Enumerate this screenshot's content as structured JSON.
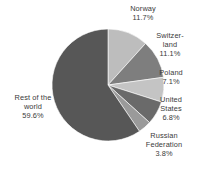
{
  "chart_data": {
    "type": "pie",
    "title": "",
    "subtitle": "",
    "xlabel": "",
    "ylabel": "",
    "legend_position": "none",
    "grid": false,
    "start_angle_deg": 0,
    "direction": "clockwise",
    "categories": [
      "Norway",
      "Switzerland",
      "Poland",
      "United States",
      "Russian Federation",
      "Rest of the world"
    ],
    "values": [
      11.7,
      11.1,
      7.1,
      6.8,
      3.8,
      59.6
    ],
    "units": "percent",
    "slices": [
      {
        "name": "Norway",
        "label_text": "Norway\n11.7%",
        "value": 11.7,
        "value_text": "11.7%",
        "color": "#bdbdbd",
        "start_deg": 0,
        "end_deg": 42.12
      },
      {
        "name": "Switzerland",
        "label_text": "Switzer-\nland\n11.1%",
        "value": 11.1,
        "value_text": "11.1%",
        "color": "#7e7e7e",
        "start_deg": 42.12,
        "end_deg": 82.08
      },
      {
        "name": "Poland",
        "label_text": "Poland\n7.1%",
        "value": 7.1,
        "value_text": "7.1%",
        "color": "#c4c4c4",
        "start_deg": 82.08,
        "end_deg": 107.64
      },
      {
        "name": "United States",
        "label_text": "United\nStates\n6.8%",
        "value": 6.8,
        "value_text": "6.8%",
        "color": "#6a6a6a",
        "start_deg": 107.64,
        "end_deg": 132.12
      },
      {
        "name": "Russian Federation",
        "label_text": "Russian\nFederation\n3.8%",
        "value": 3.8,
        "value_text": "3.8%",
        "color": "#9a9a9a",
        "start_deg": 132.12,
        "end_deg": 145.8
      },
      {
        "name": "Rest of the world",
        "label_text": "Rest of the\nworld\n59.6%",
        "value": 59.6,
        "value_text": "59.6%",
        "color": "#575757",
        "start_deg": 145.8,
        "end_deg": 360
      }
    ]
  },
  "labels": {
    "norway": "Norway\n11.7%",
    "switzerland": "Switzer-\nland\n11.1%",
    "poland": "Poland\n7.1%",
    "united_states": "United\nStates\n6.8%",
    "russian_federation": "Russian\nFederation\n3.8%",
    "rest_of_world": "Rest of the\nworld\n59.6%"
  },
  "geometry": {
    "center_x": 108,
    "center_y": 85,
    "radius": 56
  },
  "colors": {
    "background": "#ffffff",
    "text": "#3a3a3a"
  }
}
